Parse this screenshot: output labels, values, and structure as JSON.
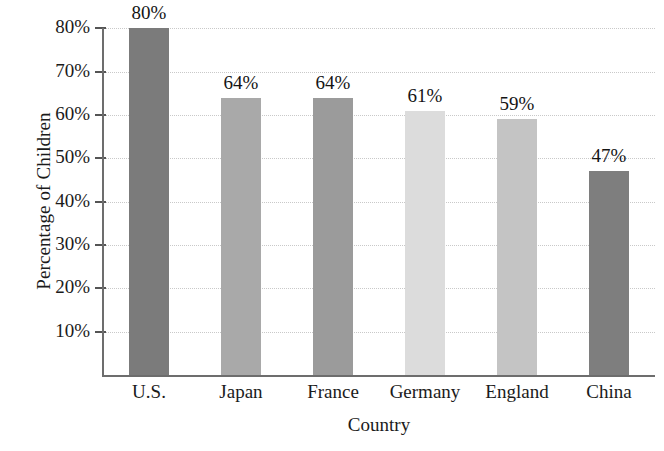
{
  "chart_data": {
    "type": "bar",
    "title": "",
    "xlabel": "Country",
    "ylabel": "Percentage of Children",
    "categories": [
      "U.S.",
      "Japan",
      "France",
      "Germany",
      "England",
      "China"
    ],
    "values": [
      80,
      64,
      64,
      61,
      59,
      47
    ],
    "value_labels": [
      "80%",
      "64%",
      "64%",
      "61%",
      "59%",
      "47%"
    ],
    "ytick_labels": [
      "80%",
      "70%",
      "60%",
      "50%",
      "40%",
      "30%",
      "20%",
      "10%"
    ],
    "ytick_values": [
      80,
      70,
      60,
      50,
      40,
      30,
      20,
      10
    ],
    "ylim": [
      0,
      80
    ],
    "grid": true,
    "grid_style": "dotted",
    "legend": "none",
    "bar_colors": [
      "#7b7b7b",
      "#a9a9a9",
      "#9b9b9b",
      "#dcdcdc",
      "#c4c4c4",
      "#7e7e7e"
    ],
    "axis_color": "#6d6d6d",
    "grid_color": "#c9c9c9",
    "background": "#ffffff"
  }
}
